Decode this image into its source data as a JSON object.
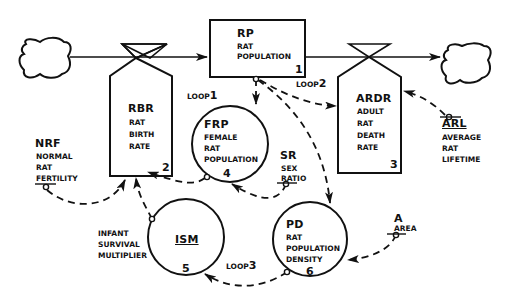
{
  "diagram": {
    "type": "system-dynamics-flow-diagram",
    "nodes": [
      {
        "id": 1,
        "code": "RP",
        "lines": [
          "RAT",
          "POPULATION"
        ],
        "shape": "level-rectangle"
      },
      {
        "id": 2,
        "code": "RBR",
        "lines": [
          "RAT",
          "BIRTH",
          "RATE"
        ],
        "shape": "rate-valve"
      },
      {
        "id": 3,
        "code": "ARDR",
        "lines": [
          "ADULT",
          "RAT",
          "DEATH",
          "RATE"
        ],
        "shape": "rate-valve"
      },
      {
        "id": 4,
        "code": "FRP",
        "lines": [
          "FEMALE",
          "RAT",
          "POPULATION"
        ],
        "shape": "auxiliary-circle"
      },
      {
        "id": 5,
        "code": "ISM",
        "lines": [
          "INFANT",
          "SURVIVAL",
          "MULTIPLIER"
        ],
        "shape": "auxiliary-circle"
      },
      {
        "id": 6,
        "code": "PD",
        "lines": [
          "RAT",
          "POPULATION",
          "DENSITY"
        ],
        "shape": "auxiliary-circle"
      }
    ],
    "constants": [
      {
        "code": "NRF",
        "lines": [
          "NORMAL",
          "RAT",
          "FERTILITY"
        ]
      },
      {
        "code": "SR",
        "lines": [
          "SEX",
          "RATIO"
        ]
      },
      {
        "code": "ARL",
        "lines": [
          "AVERAGE",
          "RAT",
          "LIFETIME"
        ]
      },
      {
        "code": "A",
        "lines": [
          "AREA"
        ]
      }
    ],
    "loops": [
      {
        "prefix": "LOOP",
        "num": "1"
      },
      {
        "prefix": "LOOP",
        "num": "2"
      },
      {
        "prefix": "LOOP",
        "num": "3"
      }
    ],
    "sources_sinks": [
      "source-cloud",
      "sink-cloud"
    ]
  }
}
